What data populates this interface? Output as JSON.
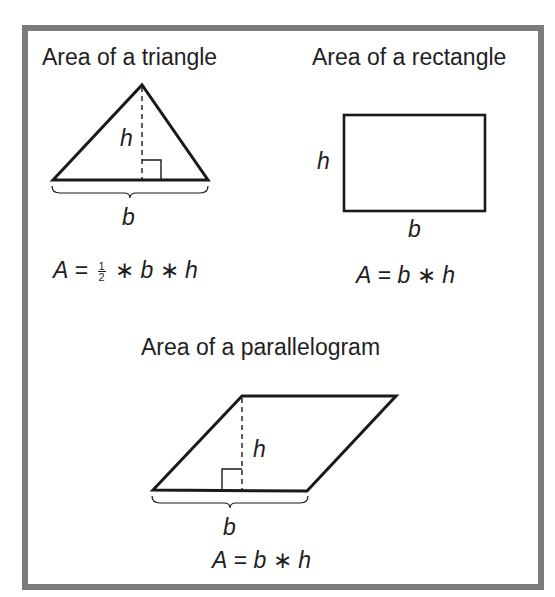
{
  "sections": {
    "triangle": {
      "title": "Area of a triangle",
      "height_label": "h",
      "base_label": "b",
      "formula": {
        "lhs": "A",
        "eq": "=",
        "frac_num": "1",
        "frac_den": "2",
        "op1": "∗",
        "v1": "b",
        "op2": "∗",
        "v2": "h"
      }
    },
    "rectangle": {
      "title": "Area of a rectangle",
      "height_label": "h",
      "base_label": "b",
      "formula": {
        "lhs": "A",
        "eq": "=",
        "v1": "b",
        "op1": "∗",
        "v2": "h"
      }
    },
    "parallelogram": {
      "title": "Area of a parallelogram",
      "height_label": "h",
      "base_label": "b",
      "formula": {
        "lhs": "A",
        "eq": "=",
        "v1": "b",
        "op1": "∗",
        "v2": "h"
      }
    }
  },
  "colors": {
    "frame": "#7b7b7b",
    "stroke": "#1a1a1a"
  }
}
